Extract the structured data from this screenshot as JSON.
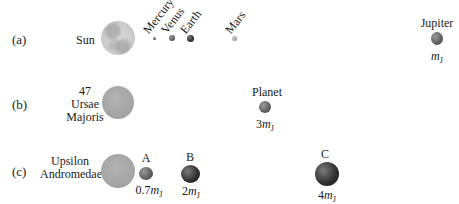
{
  "rows": {
    "a": {
      "label": "(a)",
      "star": "Sun",
      "planets": [
        {
          "name": "Mercury"
        },
        {
          "name": "Venus"
        },
        {
          "name": "Earth"
        },
        {
          "name": "Mars"
        },
        {
          "name": "Jupiter",
          "mass_prefix": "",
          "mass_symbol": "m",
          "mass_sub": "J"
        }
      ]
    },
    "b": {
      "label": "(b)",
      "star_line1": "47",
      "star_line2": "Ursae",
      "star_line3": "Majoris",
      "planet": {
        "name": "Planet",
        "mass_prefix": "3",
        "mass_symbol": "m",
        "mass_sub": "J"
      }
    },
    "c": {
      "label": "(c)",
      "star_line1": "Upsilon",
      "star_line2": "Andromedae",
      "planets": [
        {
          "name": "A",
          "mass_prefix": "0.7",
          "mass_symbol": "m",
          "mass_sub": "J"
        },
        {
          "name": "B",
          "mass_prefix": "2",
          "mass_symbol": "m",
          "mass_sub": "J"
        },
        {
          "name": "C",
          "mass_prefix": "4",
          "mass_symbol": "m",
          "mass_sub": "J"
        }
      ]
    }
  }
}
